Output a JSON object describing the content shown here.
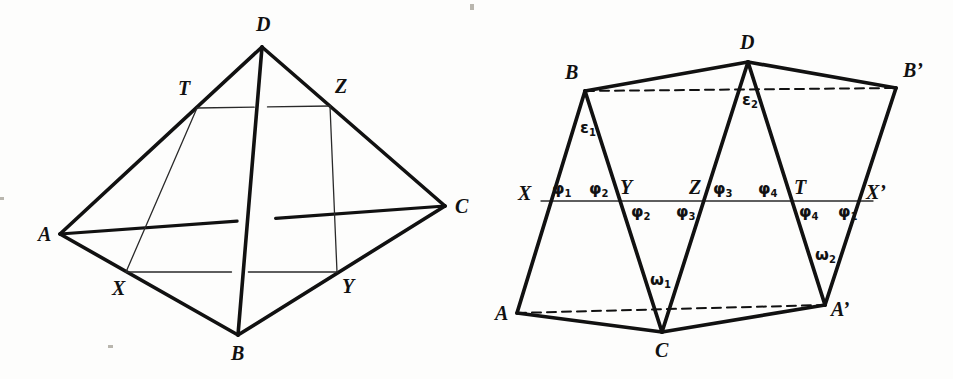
{
  "figure": {
    "background_color": "#fdfdfc",
    "stroke_color": "#111111",
    "thin_stroke_color": "#2a2a2a"
  },
  "left_diagram": {
    "name": "tetrahedron-abcd",
    "caption": "Tetrahedron ABCD with quadrilateral cross-section XYZT",
    "vertices": [
      {
        "id": "A",
        "label": "A",
        "x": 60,
        "y": 234,
        "label_x": 38,
        "label_y": 224
      },
      {
        "id": "B",
        "label": "B",
        "x": 238,
        "y": 335,
        "label_x": 231,
        "label_y": 343
      },
      {
        "id": "C",
        "label": "C",
        "x": 445,
        "y": 206,
        "label_x": 455,
        "label_y": 196
      },
      {
        "id": "D",
        "label": "D",
        "x": 262,
        "y": 47,
        "label_x": 256,
        "label_y": 14
      },
      {
        "id": "X",
        "label": "X",
        "x": 126,
        "y": 272,
        "label_x": 112,
        "label_y": 278
      },
      {
        "id": "Y",
        "label": "Y",
        "x": 337,
        "y": 272,
        "label_x": 342,
        "label_y": 276
      },
      {
        "id": "Z",
        "label": "Z",
        "x": 330,
        "y": 106,
        "label_x": 335,
        "label_y": 76
      },
      {
        "id": "T",
        "label": "T",
        "x": 197,
        "y": 108,
        "label_x": 178,
        "label_y": 78
      }
    ],
    "thick_edges": [
      {
        "from": "A",
        "to": "D"
      },
      {
        "from": "D",
        "to": "C"
      },
      {
        "from": "A",
        "to": "B"
      },
      {
        "from": "B",
        "to": "C"
      },
      {
        "from": "B",
        "to": "D"
      },
      {
        "from": "A",
        "to": "C"
      }
    ],
    "thin_edges": [
      {
        "from": "X",
        "to": "Y"
      },
      {
        "from": "T",
        "to": "Z"
      },
      {
        "from": "X",
        "to": "T"
      },
      {
        "from": "Y",
        "to": "Z"
      }
    ],
    "hidden_edge_note": "edge A-C drawn behind, broken where B-D crosses"
  },
  "right_diagram": {
    "name": "unfolded-net",
    "caption": "Unfolded net with angles phi, epsilon and omega",
    "vertices": [
      {
        "id": "A",
        "label": "A",
        "x": 517,
        "y": 313,
        "label_x": 495,
        "label_y": 303
      },
      {
        "id": "B",
        "label": "B",
        "x": 585,
        "y": 91,
        "label_x": 565,
        "label_y": 62
      },
      {
        "id": "C",
        "label": "C",
        "x": 662,
        "y": 332,
        "label_x": 655,
        "label_y": 340
      },
      {
        "id": "D",
        "label": "D",
        "x": 748,
        "y": 62,
        "label_x": 740,
        "label_y": 32
      },
      {
        "id": "Aprime",
        "label": "A’",
        "x": 825,
        "y": 305,
        "label_x": 831,
        "label_y": 299
      },
      {
        "id": "Bprime",
        "label": "B’",
        "x": 896,
        "y": 88,
        "label_x": 903,
        "label_y": 60
      },
      {
        "id": "X",
        "label": "X",
        "x": 541,
        "y": 201,
        "label_x": 518,
        "label_y": 183
      },
      {
        "id": "Y",
        "label": "Y",
        "x": 626,
        "y": 201,
        "label_x": 620,
        "label_y": 177
      },
      {
        "id": "Z",
        "label": "Z",
        "x": 698,
        "y": 201,
        "label_x": 689,
        "label_y": 177
      },
      {
        "id": "T",
        "label": "T",
        "x": 795,
        "y": 201,
        "label_x": 794,
        "label_y": 177
      },
      {
        "id": "Xprime",
        "label": "X’",
        "x": 873,
        "y": 201,
        "label_x": 866,
        "label_y": 182
      }
    ],
    "thick_edges": [
      {
        "from": "A",
        "to": "B"
      },
      {
        "from": "B",
        "to": "C"
      },
      {
        "from": "C",
        "to": "D"
      },
      {
        "from": "D",
        "to": "Aprime"
      },
      {
        "from": "Aprime",
        "to": "Bprime"
      },
      {
        "from": "B",
        "to": "D"
      },
      {
        "from": "A",
        "to": "C"
      },
      {
        "from": "C",
        "to": "Aprime"
      },
      {
        "from": "D",
        "to": "Bprime"
      }
    ],
    "dashed_edges": [
      {
        "from": "B",
        "to": "Bprime"
      },
      {
        "from": "A",
        "to": "Aprime"
      }
    ],
    "thin_edges": [
      {
        "from": "X",
        "to": "Xprime"
      }
    ],
    "angle_labels": [
      {
        "id": "phi1-top-left",
        "symbol": "φ",
        "sub": "1",
        "x": 552,
        "y": 181
      },
      {
        "id": "phi2-top-left",
        "symbol": "φ",
        "sub": "2",
        "x": 589,
        "y": 181
      },
      {
        "id": "phi3-top-mid",
        "symbol": "φ",
        "sub": "3",
        "x": 713,
        "y": 181
      },
      {
        "id": "phi4-top-mid",
        "symbol": "φ",
        "sub": "4",
        "x": 758,
        "y": 181
      },
      {
        "id": "phi2-bottom-left",
        "symbol": "φ",
        "sub": "2",
        "x": 631,
        "y": 204
      },
      {
        "id": "phi3-bottom-mid",
        "symbol": "φ",
        "sub": "3",
        "x": 676,
        "y": 204
      },
      {
        "id": "phi4-bottom-right",
        "symbol": "φ",
        "sub": "4",
        "x": 799,
        "y": 204
      },
      {
        "id": "phi1-bottom-right",
        "symbol": "φ",
        "sub": "1",
        "x": 838,
        "y": 204
      },
      {
        "id": "epsilon1",
        "symbol": "ε",
        "sub": "1",
        "x": 580,
        "y": 120
      },
      {
        "id": "epsilon2",
        "symbol": "ε",
        "sub": "2",
        "x": 742,
        "y": 92
      },
      {
        "id": "omega1",
        "symbol": "ω",
        "sub": "1",
        "x": 650,
        "y": 272
      },
      {
        "id": "omega2",
        "symbol": "ω",
        "sub": "2",
        "x": 815,
        "y": 247
      }
    ]
  },
  "artifacts": [
    {
      "id": "speck-top",
      "x": 470,
      "y": 4,
      "w": 4,
      "h": 6
    },
    {
      "id": "speck-left-mid",
      "x": 0,
      "y": 197,
      "w": 4,
      "h": 3
    },
    {
      "id": "speck-bottom-left",
      "x": 108,
      "y": 345,
      "w": 5,
      "h": 3
    }
  ]
}
